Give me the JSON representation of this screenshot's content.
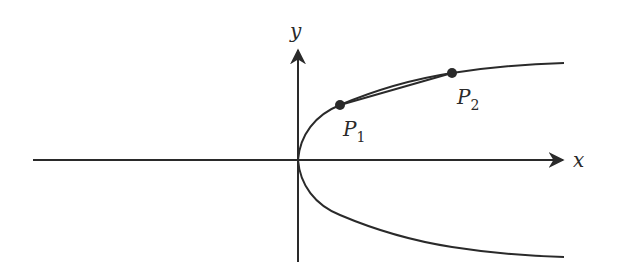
{
  "diagram": {
    "axes": {
      "x_label": "x",
      "y_label": "y"
    },
    "curve": {
      "description": "Sideways parabola-like curve opening to the right, vertex at origin"
    },
    "points": [
      {
        "name": "P",
        "subscript": "1"
      },
      {
        "name": "P",
        "subscript": "2"
      }
    ],
    "colors": {
      "stroke": "#2a2a2a",
      "background": "#ffffff"
    }
  }
}
